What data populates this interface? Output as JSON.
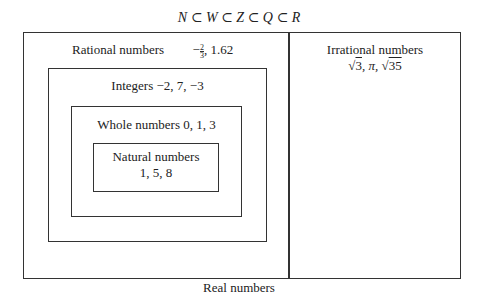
{
  "title": "N ⊂ W ⊂ Z ⊂ Q ⊂ R",
  "footer": "Real numbers",
  "sets": {
    "rational": {
      "label": "Rational numbers",
      "examples_minus": "−",
      "frac_num": "2",
      "frac_den": "3",
      "examples_rest": ", 1.62"
    },
    "irrational": {
      "label": "Irrational numbers",
      "sqrt": "√",
      "r1": "3",
      "mid": ", π, ",
      "r2": "35"
    },
    "integers": {
      "label": "Integers −2, 7, −3"
    },
    "whole": {
      "label": "Whole numbers 0, 1, 3"
    },
    "natural": {
      "label": "Natural numbers",
      "examples": "1, 5, 8"
    }
  }
}
